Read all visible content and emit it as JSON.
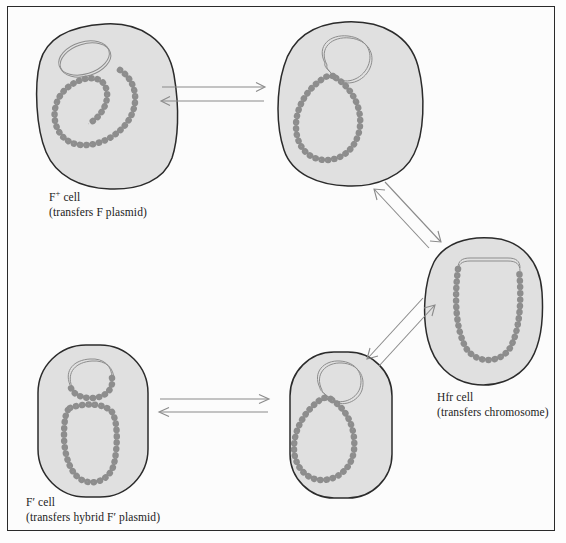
{
  "figure": {
    "kind": "bacterial-conjugation-state-diagram",
    "frame": {
      "border_color": "#2a2a2a",
      "background": "#fcfcfc"
    },
    "palette": {
      "cell_fill": "#e0e0e0",
      "cell_stroke": "#2b2b2b",
      "dna_stroke": "#8d8d8d",
      "arrow_stroke": "#8a8a8a",
      "text": "#1b1b1b",
      "page_background": "#ffffff"
    }
  },
  "cells": [
    {
      "id": "f-plus-cell",
      "position": "top-left",
      "label_line1": "F",
      "label_sup": "+",
      "label_line1_tail": " cell",
      "label_line2": "(transfers F plasmid)",
      "contents": [
        "free circular F plasmid",
        "circular bacterial chromosome"
      ],
      "plasmid_state": "free"
    },
    {
      "id": "conjugating-top-cell",
      "position": "top-middle",
      "label_line1": "",
      "label_sup": "",
      "label_line1_tail": "",
      "label_line2": "",
      "contents": [
        "F plasmid contacting chromosome",
        "circular bacterial chromosome"
      ],
      "plasmid_state": "pairing"
    },
    {
      "id": "hfr-cell",
      "position": "right",
      "label_line1": "Hfr",
      "label_sup": "",
      "label_line1_tail": " cell",
      "label_line2": "(transfers chromosome)",
      "contents": [
        "F plasmid integrated into chromosome"
      ],
      "plasmid_state": "integrated"
    },
    {
      "id": "excising-bottom-cell",
      "position": "bottom-middle",
      "label_line1": "",
      "label_sup": "",
      "label_line1_tail": "",
      "label_line2": "",
      "contents": [
        "F plasmid excising from chromosome",
        "chromosome loop"
      ],
      "plasmid_state": "excising"
    },
    {
      "id": "f-prime-cell",
      "position": "bottom-left",
      "label_line1": "F",
      "label_sup": "′",
      "label_line1_tail": " cell",
      "label_line2": "(transfers hybrid F′ plasmid)",
      "contents": [
        "hybrid F′ plasmid",
        "bacterial chromosome"
      ],
      "plasmid_state": "hybrid-free"
    }
  ],
  "arrows": [
    {
      "id": "arrow-top-horizontal",
      "from": "f-plus-cell",
      "to": "conjugating-top-cell",
      "style": "double-reversible-horizontal"
    },
    {
      "id": "arrow-upper-diagonal",
      "from": "conjugating-top-cell",
      "to": "hfr-cell",
      "style": "double-reversible-diagonal"
    },
    {
      "id": "arrow-lower-diagonal",
      "from": "hfr-cell",
      "to": "excising-bottom-cell",
      "style": "double-reversible-diagonal"
    },
    {
      "id": "arrow-bottom-horizontal",
      "from": "excising-bottom-cell",
      "to": "f-prime-cell",
      "style": "double-reversible-horizontal"
    }
  ]
}
